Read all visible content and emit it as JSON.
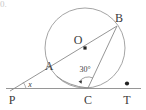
{
  "figure": {
    "corner_label": "0.",
    "type": "circle-tangent-secant-geometry",
    "labels": {
      "center": "O",
      "point_a": "A",
      "point_b": "B",
      "point_c": "C",
      "point_p": "P",
      "point_t": "T",
      "angle_at_p": "x",
      "angle_at_c": "30°"
    },
    "colors": {
      "stroke": "#7a7a7a",
      "circle_stroke": "#8a8a8a",
      "text": "#3a3a3a",
      "dot": "#222222",
      "background": "#ffffff"
    },
    "geometry": {
      "circle": {
        "cx": 85,
        "cy": 48,
        "r": 40
      },
      "points": {
        "O": {
          "x": 85,
          "y": 48
        },
        "A": {
          "x": 56.5,
          "y": 76
        },
        "B": {
          "x": 116.5,
          "y": 26
        },
        "C": {
          "x": 88,
          "y": 88
        },
        "P": {
          "x": 12,
          "y": 88
        },
        "T": {
          "x": 127,
          "y": 88
        }
      },
      "segments": [
        {
          "name": "line-PT",
          "from": "P",
          "to": "T"
        },
        {
          "name": "secant-PB",
          "from": "P",
          "to": "B"
        },
        {
          "name": "chord-BC",
          "from": "B",
          "to": "C"
        },
        {
          "name": "chord-AC",
          "from": "A",
          "to": "C"
        }
      ],
      "markers": {
        "dot_O": true,
        "dot_T": true,
        "arc_at_P": true,
        "arc_at_C": true
      }
    }
  }
}
